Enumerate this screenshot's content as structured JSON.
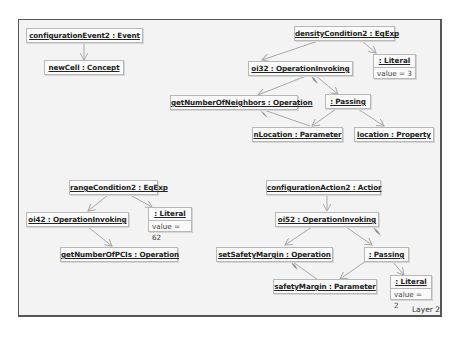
{
  "diagram": {
    "layer_label": "Layer 2",
    "nodes": {
      "configurationEvent2": "configurationEvent2 : Event",
      "newCell": "newCell : Concept",
      "densityCondition2": "densityCondition2 : EqExp",
      "literal1": {
        "title": ": Literal",
        "attr": "value = 3"
      },
      "oi32": "oi32 : OperationInvoking",
      "getNumberOfNeighbors": "getNumberOfNeighbors : Operation",
      "passing1": ": Passing",
      "nLocation": "nLocation : Parameter",
      "location": "location : Property",
      "rangeCondition2": "rangeCondition2 : EqExp",
      "literal2": {
        "title": ": Literal",
        "attr": "value = 62"
      },
      "oi42": "oi42 : OperationInvoking",
      "getNumberOfPCIs": "getNumberOfPCIs : Operation",
      "configurationAction2": "configurationAction2 : Actior",
      "oi52": "oi52 : OperationInvoking",
      "setSafetyMargin": "setSafetyMargin : Operation",
      "passing2": ": Passing",
      "safetyMargin": "safetyMargin : Parameter",
      "literal3": {
        "title": ": Literal",
        "attr": "value = 2"
      }
    },
    "colors": {
      "frame_border": "#555555",
      "canvas": "#f3f3f3",
      "node_border": "#b8b8b8",
      "edge": "#a8a8a8",
      "diamond": "#8c8c8c"
    }
  }
}
